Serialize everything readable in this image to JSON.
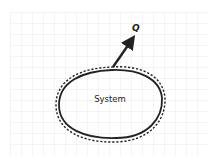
{
  "diagram": {
    "system_label": "System",
    "heat_label": "Q",
    "colors": {
      "grid": "#e4e4e4",
      "stroke": "#222222",
      "background": "#ffffff"
    },
    "icons": {
      "arrow": "arrow-up-right-icon"
    }
  }
}
